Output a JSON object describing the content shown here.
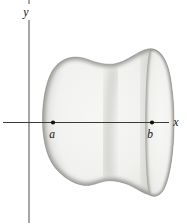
{
  "figure": {
    "type": "solid-of-revolution-diagram",
    "labels": {
      "y_axis": "y",
      "x_axis": "x",
      "point_a": "a",
      "point_b": "b"
    },
    "colors": {
      "background": "#ffffff",
      "axis": "#3a3a36",
      "label_text": "#151515",
      "point_dot": "#111111",
      "solid_fill_light": "#f5f5f3",
      "solid_fill_edge": "#dcdcd8",
      "shading_dark": "#6e6d68"
    }
  }
}
